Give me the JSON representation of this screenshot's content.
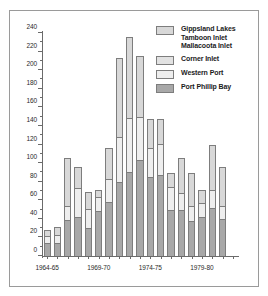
{
  "chart_data": {
    "type": "bar",
    "subtype": "stacked",
    "title": "",
    "xlabel": "",
    "ylabel": "",
    "ylim": [
      0,
      240
    ],
    "ytick_step": 20,
    "yticks": [
      0,
      20,
      40,
      60,
      80,
      100,
      120,
      140,
      160,
      180,
      200,
      220,
      240
    ],
    "ytick_labels": [
      "0",
      "20",
      "40",
      "60",
      "80",
      "100",
      "120",
      "140",
      "160",
      "180",
      "200",
      "220",
      "240"
    ],
    "grid": false,
    "legend_position": "top-right",
    "categories": [
      "1964-65",
      "1965-66",
      "1966-67",
      "1967-68",
      "1968-69",
      "1969-70",
      "1970-71",
      "1971-72",
      "1972-73",
      "1973-74",
      "1974-75",
      "1975-76",
      "1976-77",
      "1977-78",
      "1978-79",
      "1979-80",
      "1980-81",
      "1981-82",
      "1982-83"
    ],
    "xtick_labels": [
      "1964-65",
      "1969-70",
      "1974-75",
      "1979-80"
    ],
    "xtick_label_indices": [
      0,
      5,
      10,
      15
    ],
    "series": [
      {
        "name": "Port Phillip Bay",
        "color": "#a8a8a8",
        "values": [
          14,
          14,
          39,
          42,
          30,
          48,
          58,
          80,
          90,
          103,
          85,
          87,
          50,
          49,
          38,
          42,
          52,
          40,
          0
        ]
      },
      {
        "name": "Western Port",
        "color": "#eeeeee",
        "values": [
          8,
          9,
          15,
          31,
          21,
          16,
          25,
          48,
          59,
          47,
          31,
          34,
          24,
          19,
          16,
          15,
          19,
          14,
          0
        ]
      },
      {
        "name": "Corner Inlet",
        "color": "#e2e2e2",
        "values": [
          0,
          0,
          0,
          0,
          0,
          0,
          0,
          0,
          0,
          0,
          0,
          0,
          0,
          0,
          0,
          0,
          0,
          0,
          0
        ]
      },
      {
        "name": "Gippsland Lakes\nTamboon Inlet\nMallacoota Inlet",
        "color": "#d8d8d8",
        "values": [
          6,
          8,
          52,
          23,
          18,
          7,
          33,
          85,
          87,
          65,
          31,
          27,
          15,
          37,
          35,
          14,
          49,
          42,
          0
        ]
      }
    ],
    "totals": [
      28,
      31,
      106,
      96,
      69,
      71,
      116,
      213,
      236,
      215,
      147,
      148,
      89,
      105,
      89,
      71,
      120,
      96,
      0
    ],
    "annotations": []
  },
  "legend": {
    "entries": [
      {
        "label": "Gippsland Lakes\nTamboon Inlet\nMallacoota Inlet",
        "swatch": "gippsland-lakes-swatch"
      },
      {
        "label": "Corner Inlet",
        "swatch": "corner-inlet-swatch"
      },
      {
        "label": "Western Port",
        "swatch": "western-port-swatch"
      },
      {
        "label": "Port Phillip Bay",
        "swatch": "port-phillip-bay-swatch"
      }
    ]
  },
  "axes": {
    "y": {
      "labels": [
        "240",
        "220",
        "200",
        "180",
        "160",
        "140",
        "120",
        "100",
        "80",
        "60",
        "40",
        "20",
        "0"
      ]
    },
    "x": {
      "labels": [
        "1964-65",
        "1969-70",
        "1974-75",
        "1979-80"
      ]
    }
  },
  "colors": {
    "frame": "#9a9a9a",
    "axis": "#6b6b6b",
    "bar_outline": "#7d7d7d",
    "port_phillip_bay": "#a8a8a8",
    "western_port": "#eeeeee",
    "corner_inlet": "#e2e2e2",
    "gippsland_lakes": "#d8d8d8",
    "background": "#ffffff"
  }
}
